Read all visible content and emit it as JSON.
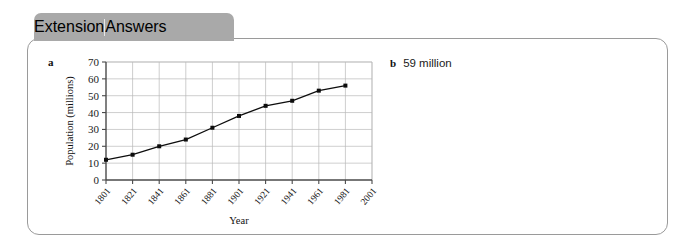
{
  "tab": {
    "primary_label": "Extension",
    "secondary_label": "Answers",
    "background_color": "#a9a9a9"
  },
  "panel": {
    "border_color": "#9a9a9a"
  },
  "answers": {
    "part_a_label": "a",
    "part_b_label": "b",
    "part_b_text": "59 million"
  },
  "chart_data": {
    "type": "line",
    "title": "",
    "xlabel": "Year",
    "ylabel": "Population (millions)",
    "categories": [
      "1801",
      "1821",
      "1841",
      "1861",
      "1881",
      "1901",
      "1921",
      "1941",
      "1961",
      "1981",
      "2001"
    ],
    "x": [
      1801,
      1821,
      1841,
      1861,
      1881,
      1901,
      1921,
      1941,
      1961,
      1981,
      2001
    ],
    "values": [
      12,
      15,
      20,
      24,
      31,
      38,
      44,
      47,
      53,
      56,
      null
    ],
    "series": [
      {
        "name": "Population",
        "values": [
          12,
          15,
          20,
          24,
          31,
          38,
          44,
          47,
          53,
          56,
          null
        ]
      }
    ],
    "xlim": [
      1801,
      2001
    ],
    "ylim": [
      0,
      70
    ],
    "ytick_values": [
      0,
      10,
      20,
      30,
      40,
      50,
      60,
      70
    ],
    "ytick_labels": [
      "0",
      "10",
      "20",
      "30",
      "40",
      "50",
      "60",
      "70"
    ],
    "grid": true,
    "legend": false,
    "line_color": "#0d0d0d",
    "marker": "square"
  }
}
